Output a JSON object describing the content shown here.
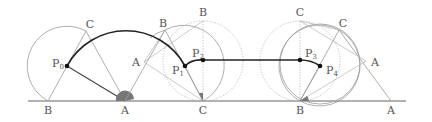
{
  "figure": {
    "colors": {
      "ground": "#666666",
      "thin": "#9a9a9a",
      "dotted": "#b0b0b0",
      "locus": "#222222",
      "segment": "#444444",
      "angle_fill": "#777777",
      "point": "#111111"
    },
    "ground_labels": [
      {
        "text": "B",
        "x": 48,
        "y": 114
      },
      {
        "text": "A",
        "x": 125,
        "y": 114
      },
      {
        "text": "C",
        "x": 203,
        "y": 114
      },
      {
        "text": "B",
        "x": 300,
        "y": 114
      },
      {
        "text": "A",
        "x": 391,
        "y": 114
      }
    ],
    "vertex_labels": [
      {
        "text": "C",
        "x": 90,
        "y": 28
      },
      {
        "text": "A",
        "x": 132,
        "y": 65
      },
      {
        "text": "B",
        "x": 163,
        "y": 27
      },
      {
        "text": "B",
        "x": 203,
        "y": 16
      },
      {
        "text": "C",
        "x": 300,
        "y": 16
      },
      {
        "text": "C",
        "x": 343,
        "y": 27
      },
      {
        "text": "A",
        "x": 376,
        "y": 65
      }
    ],
    "points": [
      {
        "label": "P",
        "sub": "0",
        "x": 67,
        "y": 66,
        "lx": 52,
        "ly": 66
      },
      {
        "label": "P",
        "sub": "1",
        "x": 185,
        "y": 66,
        "lx": 172,
        "ly": 73
      },
      {
        "label": "P",
        "sub": "2",
        "x": 203,
        "y": 60,
        "lx": 193,
        "ly": 57
      },
      {
        "label": "P",
        "sub": "3",
        "x": 300,
        "y": 60,
        "lx": 305,
        "ly": 57
      },
      {
        "label": "P",
        "sub": "4",
        "x": 320,
        "y": 66,
        "lx": 326,
        "ly": 73
      }
    ]
  }
}
